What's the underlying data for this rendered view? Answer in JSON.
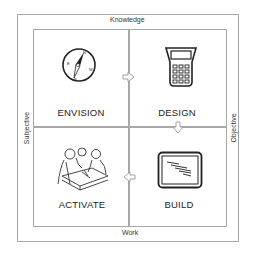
{
  "axes": {
    "top": "Knowledge",
    "bottom": "Work",
    "left": "Subjective",
    "right": "Objective"
  },
  "quadrants": [
    {
      "position": "top-left",
      "label": "ENVISION",
      "icon": "compass-icon"
    },
    {
      "position": "top-right",
      "label": "DESIGN",
      "icon": "calculator-icon"
    },
    {
      "position": "bottom-left",
      "label": "ACTIVATE",
      "icon": "people-collaborating-icon"
    },
    {
      "position": "bottom-right",
      "label": "BUILD",
      "icon": "monitor-icon"
    }
  ],
  "flow_arrows": [
    {
      "from": "ENVISION",
      "to": "DESIGN",
      "direction": "right"
    },
    {
      "from": "DESIGN",
      "to": "BUILD",
      "direction": "down"
    },
    {
      "from": "BUILD",
      "to": "ACTIVATE",
      "direction": "left"
    }
  ],
  "colors": {
    "border": "#a8a8a8",
    "text": "#333333",
    "icon_stroke": "#222222"
  }
}
